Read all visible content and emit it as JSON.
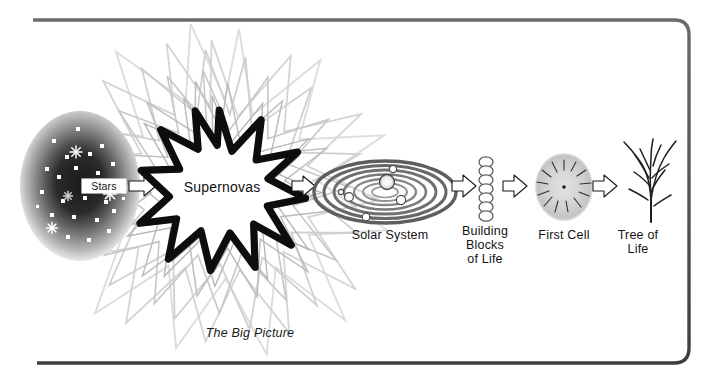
{
  "figure": {
    "caption": "The Big Picture",
    "border_color": "#555555",
    "accent_dark": "#111111",
    "accent_gray": "#9a9a9a",
    "background": "#ffffff"
  },
  "stages": [
    {
      "id": "stars",
      "label": "Stars",
      "icon": "galaxy-nebula-icon",
      "order": 1
    },
    {
      "id": "supernovas",
      "label": "Supernovas",
      "icon": "starburst-explosion-icon",
      "order": 2
    },
    {
      "id": "solar-system",
      "label": "Solar System",
      "icon": "orbital-rings-icon",
      "order": 3
    },
    {
      "id": "building-blocks",
      "label": "Building\nBlocks\nof Life",
      "icon": "molecule-chain-icon",
      "order": 4
    },
    {
      "id": "first-cell",
      "label": "First Cell",
      "icon": "cell-radial-icon",
      "order": 5
    },
    {
      "id": "tree-of-life",
      "label": "Tree of\nLife",
      "icon": "branching-tree-icon",
      "order": 6
    }
  ],
  "arrows": [
    {
      "id": "arrow-stars-to-supernovas",
      "from": "stars",
      "to": "supernovas"
    },
    {
      "id": "arrow-supernovas-to-solar",
      "from": "supernovas",
      "to": "solar-system"
    },
    {
      "id": "arrow-solar-to-blocks",
      "from": "solar-system",
      "to": "building-blocks"
    },
    {
      "id": "arrow-blocks-to-cell",
      "from": "building-blocks",
      "to": "first-cell"
    },
    {
      "id": "arrow-cell-to-tree",
      "from": "first-cell",
      "to": "tree-of-life"
    }
  ]
}
